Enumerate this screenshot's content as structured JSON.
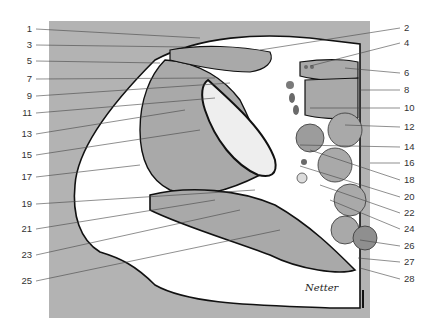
{
  "figure": {
    "type": "anatomical cross-section",
    "signature": "Netter",
    "colors": {
      "background_panel": "#b3b3b3",
      "muscle": "#a9a9a9",
      "fat": "#ffffff",
      "outline": "#111111",
      "bone": "#eeeeee",
      "vessel": "#7a7a7a",
      "leader_line": "#444444",
      "label_text": "#333333"
    }
  },
  "labels": {
    "left": [
      {
        "num": "1",
        "y": 29
      },
      {
        "num": "3",
        "y": 45
      },
      {
        "num": "5",
        "y": 61
      },
      {
        "num": "7",
        "y": 79
      },
      {
        "num": "9",
        "y": 96
      },
      {
        "num": "11",
        "y": 113
      },
      {
        "num": "13",
        "y": 134
      },
      {
        "num": "15",
        "y": 155
      },
      {
        "num": "17",
        "y": 177
      },
      {
        "num": "19",
        "y": 204
      },
      {
        "num": "21",
        "y": 229
      },
      {
        "num": "23",
        "y": 255
      },
      {
        "num": "25",
        "y": 281
      }
    ],
    "right": [
      {
        "num": "2",
        "y": 28
      },
      {
        "num": "4",
        "y": 43
      },
      {
        "num": "6",
        "y": 73
      },
      {
        "num": "8",
        "y": 90
      },
      {
        "num": "10",
        "y": 108
      },
      {
        "num": "12",
        "y": 127
      },
      {
        "num": "14",
        "y": 147
      },
      {
        "num": "16",
        "y": 163
      },
      {
        "num": "18",
        "y": 180
      },
      {
        "num": "20",
        "y": 197
      },
      {
        "num": "22",
        "y": 213
      },
      {
        "num": "24",
        "y": 229
      },
      {
        "num": "26",
        "y": 246
      },
      {
        "num": "27",
        "y": 262
      },
      {
        "num": "28",
        "y": 279
      }
    ]
  }
}
